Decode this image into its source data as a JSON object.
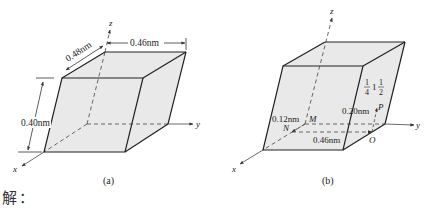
{
  "figure_a": {
    "caption": "(a)",
    "axes": {
      "x": "x",
      "y": "y",
      "z": "z"
    },
    "dimensions": {
      "depth": "0.48nm",
      "width": "0.46nm",
      "height": "0.40nm"
    }
  },
  "figure_b": {
    "caption": "(b)",
    "axes": {
      "x": "x",
      "y": "y",
      "z": "z"
    },
    "points": {
      "M": "M",
      "N": "N",
      "O": "O",
      "P": "P"
    },
    "dimensions": {
      "nm_offset": "0.12nm",
      "width": "0.46nm",
      "height": "0.20nm"
    },
    "coordinate_label": {
      "frac1_num": "1",
      "frac1_den": "4",
      "mid": "1",
      "frac2_num": "1",
      "frac2_den": "2"
    }
  },
  "solution_label": "解："
}
